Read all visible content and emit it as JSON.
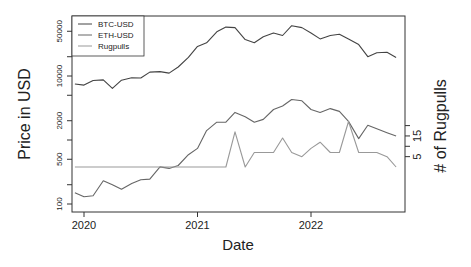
{
  "chart_data": {
    "type": "line",
    "title": "",
    "xlabel": "Date",
    "ylabel": "Price in USD",
    "ylabel_right": "# of Rugpulls",
    "xlim": [
      2019.9,
      2022.85
    ],
    "ylim": [
      85,
      75000
    ],
    "yscale": "log",
    "ylim_right": [
      0,
      50
    ],
    "x_ticks": [
      2020,
      2021,
      2022
    ],
    "x_tick_labels": [
      "2020",
      "2021",
      "2022"
    ],
    "y_ticks": [
      100,
      500,
      2000,
      10000,
      50000
    ],
    "y_tick_labels": [
      "100",
      "500",
      "2000",
      "10000",
      "50000"
    ],
    "y_minor_ticks": [
      200,
      1000,
      5000,
      20000
    ],
    "y_right_ticks": [
      5,
      10,
      15,
      20
    ],
    "y_right_tick_labels": [
      "5",
      "",
      "15",
      ""
    ],
    "grid": false,
    "legend_position": "top-left",
    "series": [
      {
        "name": "BTC-USD",
        "axis": "left",
        "color": "#444444",
        "x": [
          2019.92,
          2020.0,
          2020.08,
          2020.17,
          2020.25,
          2020.33,
          2020.42,
          2020.5,
          2020.58,
          2020.67,
          2020.75,
          2020.83,
          2020.92,
          2021.0,
          2021.08,
          2021.17,
          2021.25,
          2021.33,
          2021.42,
          2021.5,
          2021.58,
          2021.67,
          2021.75,
          2021.83,
          2021.92,
          2022.0,
          2022.08,
          2022.17,
          2022.25,
          2022.33,
          2022.42,
          2022.5,
          2022.58,
          2022.67,
          2022.75
        ],
        "values": [
          7500,
          7200,
          8500,
          8700,
          6400,
          8600,
          9400,
          9300,
          11500,
          11700,
          11100,
          13800,
          19500,
          29000,
          33000,
          49000,
          58000,
          57000,
          37000,
          33000,
          41000,
          47000,
          43000,
          61000,
          57000,
          47000,
          38000,
          43000,
          45000,
          38000,
          31000,
          20000,
          23000,
          23500,
          19500
        ]
      },
      {
        "name": "ETH-USD",
        "axis": "left",
        "color": "#666666",
        "x": [
          2019.92,
          2020.0,
          2020.08,
          2020.17,
          2020.25,
          2020.33,
          2020.42,
          2020.5,
          2020.58,
          2020.67,
          2020.75,
          2020.83,
          2020.92,
          2021.0,
          2021.08,
          2021.17,
          2021.25,
          2021.33,
          2021.42,
          2021.5,
          2021.58,
          2021.67,
          2021.75,
          2021.83,
          2021.92,
          2022.0,
          2022.08,
          2022.17,
          2022.25,
          2022.33,
          2022.42,
          2022.5,
          2022.58,
          2022.67,
          2022.75
        ],
        "values": [
          150,
          130,
          135,
          230,
          200,
          170,
          210,
          240,
          245,
          380,
          360,
          400,
          590,
          740,
          1400,
          1900,
          1900,
          2700,
          2300,
          1900,
          2100,
          3000,
          3400,
          4300,
          4100,
          3000,
          2700,
          3100,
          2800,
          1950,
          1050,
          1700,
          1500,
          1300,
          1150
        ]
      },
      {
        "name": "Rugpulls",
        "axis": "right",
        "color": "#999999",
        "x": [
          2019.92,
          2020.0,
          2020.08,
          2020.17,
          2020.25,
          2020.33,
          2020.42,
          2020.5,
          2020.58,
          2020.67,
          2020.75,
          2020.83,
          2020.92,
          2021.0,
          2021.08,
          2021.17,
          2021.25,
          2021.33,
          2021.42,
          2021.5,
          2021.58,
          2021.67,
          2021.75,
          2021.83,
          2021.92,
          2022.0,
          2022.08,
          2022.17,
          2022.25,
          2022.33,
          2022.42,
          2022.5,
          2022.58,
          2022.67,
          2022.75
        ],
        "values": [
          0,
          0,
          0,
          0,
          0,
          0,
          0,
          0,
          0,
          0,
          0,
          0,
          0,
          0,
          0,
          0,
          0,
          17,
          0,
          7,
          7,
          7,
          14,
          7,
          5,
          9,
          12,
          7,
          7,
          22,
          7,
          7,
          7,
          5,
          0
        ]
      }
    ]
  },
  "legend": {
    "items": [
      {
        "label": "BTC-USD",
        "color": "#444444"
      },
      {
        "label": "ETH-USD",
        "color": "#666666"
      },
      {
        "label": "Rugpulls",
        "color": "#999999"
      }
    ]
  },
  "labels": {
    "xlabel": "Date",
    "ylabel": "Price in USD",
    "ylabel_right": "# of Rugpulls"
  }
}
